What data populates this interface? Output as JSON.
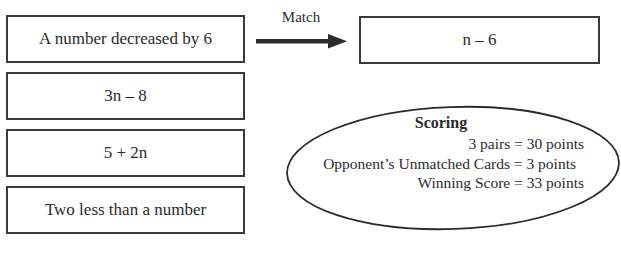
{
  "cards": {
    "left": [
      {
        "text": "A number decreased by 6"
      },
      {
        "text": "3n – 8"
      },
      {
        "text": "5 + 2n"
      },
      {
        "text": "Two less than a number"
      }
    ],
    "matched": {
      "text": "n – 6"
    }
  },
  "match_arrow": {
    "label": "Match",
    "icon": "right-arrow-icon"
  },
  "scoring": {
    "title": "Scoring",
    "lines": [
      "3 pairs = 30 points",
      "Opponent’s Unmatched Cards = 3 points",
      "Winning Score = 33 points"
    ]
  },
  "colors": {
    "ink": "#2b2b2b",
    "border": "#3a3a3a",
    "background": "#ffffff"
  }
}
